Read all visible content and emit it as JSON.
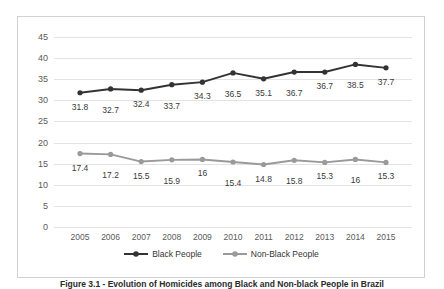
{
  "chart_data": {
    "type": "line",
    "title": "",
    "xlabel": "",
    "ylabel": "",
    "categories": [
      "2005",
      "2006",
      "2007",
      "2008",
      "2009",
      "2010",
      "2011",
      "2012",
      "2013",
      "2014",
      "2015"
    ],
    "ylim": [
      0,
      45
    ],
    "yticks": [
      0,
      5,
      10,
      15,
      20,
      25,
      30,
      35,
      40,
      45
    ],
    "grid": true,
    "legend_position": "bottom",
    "data_labels": true,
    "series": [
      {
        "name": "Black People",
        "color": "#333333",
        "marker": "circle",
        "values": [
          31.8,
          32.7,
          32.4,
          33.7,
          34.3,
          36.5,
          35.1,
          36.7,
          36.7,
          38.5,
          37.7
        ],
        "labels": [
          "31.8",
          "32.7",
          "32.4",
          "33.7",
          "34.3",
          "36.5",
          "35.1",
          "36.7",
          "36.7",
          "38.5",
          "37.7"
        ]
      },
      {
        "name": "Non-Black People",
        "color": "#9a9a9a",
        "marker": "circle",
        "values": [
          17.4,
          17.2,
          15.5,
          15.9,
          16,
          15.4,
          14.8,
          15.8,
          15.3,
          16,
          15.3
        ],
        "labels": [
          "17.4",
          "17.2",
          "15.5",
          "15.9",
          "16",
          "15.4",
          "14.8",
          "15.8",
          "15.3",
          "16",
          "15.3"
        ]
      }
    ]
  },
  "legend": {
    "items": [
      {
        "label": "Black People",
        "color": "#333333"
      },
      {
        "label": "Non-Black People",
        "color": "#9a9a9a"
      }
    ]
  },
  "caption": {
    "text": "Figure 3.1 - Evolution of Homicides among Black and Non-black People in Brazil"
  }
}
